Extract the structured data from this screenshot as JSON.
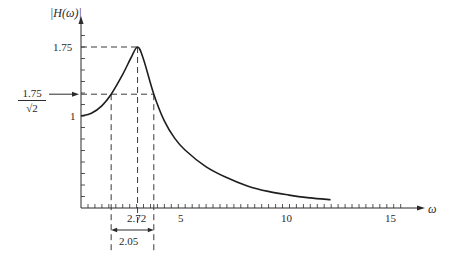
{
  "chart_data": {
    "type": "line",
    "title": "",
    "xlabel": "ω",
    "ylabel": "|H(ω)|",
    "xlim": [
      0,
      16
    ],
    "ylim": [
      0,
      1.9
    ],
    "grid": false,
    "legend": null,
    "x_ticks": [
      5,
      10,
      15
    ],
    "x_tick_labels": [
      "5",
      "10",
      "15"
    ],
    "y_ticks": [
      1,
      1.75
    ],
    "y_tick_labels": [
      "1",
      "1.75"
    ],
    "series": [
      {
        "name": "|H(ω)|",
        "x": [
          0,
          0.5,
          1.0,
          1.45,
          2.0,
          2.4,
          2.72,
          3.0,
          3.5,
          4.0,
          4.5,
          5.0,
          6.0,
          7.0,
          8.0,
          9.0,
          10.0,
          11.0,
          12.0
        ],
        "values": [
          1.0,
          1.03,
          1.11,
          1.237,
          1.45,
          1.63,
          1.75,
          1.62,
          1.237,
          0.95,
          0.76,
          0.63,
          0.45,
          0.33,
          0.24,
          0.18,
          0.14,
          0.11,
          0.09
        ]
      }
    ],
    "annotations": {
      "peak": {
        "omega": 2.72,
        "value": 1.75,
        "omega_label": "2.72",
        "value_label": "1.75"
      },
      "half_power": {
        "value": 1.237,
        "label_numerator": "1.75",
        "label_denominator": "√2",
        "omega_low": 1.45,
        "omega_high": 3.5
      },
      "bandwidth": {
        "value": 2.05,
        "label": "2.05"
      }
    }
  },
  "labels": {
    "y_axis": "|H(ω)|",
    "x_axis": "ω",
    "peak_value": "1.75",
    "one": "1",
    "half_power_num": "1.75",
    "half_power_den": "√2",
    "peak_omega": "2.72",
    "bandwidth": "2.05",
    "tick_5": "5",
    "tick_10": "10",
    "tick_15": "15"
  },
  "colors": {
    "ink": "#2a2a2a",
    "curve": "#1e1e1e",
    "dash": "#3a3a3a"
  }
}
